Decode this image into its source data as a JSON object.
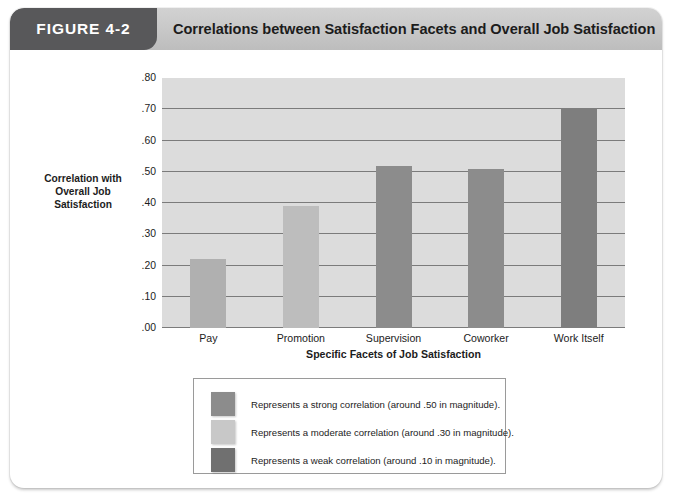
{
  "figure": {
    "badge_label": "FIGURE 4-2",
    "title": "Correlations between Satisfaction Facets and Overall Job Satisfaction",
    "badge_color": "#58585a",
    "header_color": "#c9c9c9"
  },
  "chart_data": {
    "type": "bar",
    "title": "Correlations between Satisfaction Facets and Overall Job Satisfaction",
    "xlabel": "Specific Facets of Job Satisfaction",
    "ylabel": "Correlation with Overall Job Satisfaction",
    "ylabel_lines": "Correlation with\nOverall Job\nSatisfaction",
    "categories": [
      "Pay",
      "Promotion",
      "Supervision",
      "Coworker",
      "Work Itself"
    ],
    "values": [
      0.22,
      0.39,
      0.52,
      0.51,
      0.705
    ],
    "bar_colors": [
      "#b0b0b0",
      "#bdbdbd",
      "#8c8c8c",
      "#8c8c8c",
      "#7e7e7e"
    ],
    "ylim": [
      0.0,
      0.8
    ],
    "ytick_labels": [
      ".80",
      ".70",
      ".60",
      ".50",
      ".40",
      ".30",
      ".20",
      ".10",
      ".00"
    ],
    "ytick_values": [
      0.8,
      0.7,
      0.6,
      0.5,
      0.4,
      0.3,
      0.2,
      0.1,
      0.0
    ],
    "grid": true,
    "gridline_color": "#7b7b7b",
    "plot_background": "#dcdcdc",
    "legend_position": "below-center"
  },
  "legend": {
    "items": [
      {
        "swatch_color": "#8c8c8c",
        "label": "Represents a strong correlation (around .50 in magnitude)."
      },
      {
        "swatch_color": "#c8c8c8",
        "label": "Represents a moderate correlation (around .30 in magnitude)."
      },
      {
        "swatch_color": "#707070",
        "label": "Represents a weak correlation (around .10 in magnitude)."
      }
    ]
  }
}
